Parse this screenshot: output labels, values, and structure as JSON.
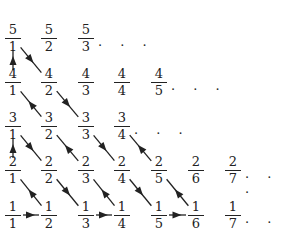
{
  "diagram": {
    "ellipsis": ". . .",
    "fractions": [
      {
        "n": "5",
        "d": "1",
        "col": 0,
        "row": 4
      },
      {
        "n": "5",
        "d": "2",
        "col": 1,
        "row": 4
      },
      {
        "n": "5",
        "d": "3",
        "col": 2,
        "row": 4,
        "dots": true
      },
      {
        "n": "4",
        "d": "1",
        "col": 0,
        "row": 3
      },
      {
        "n": "4",
        "d": "2",
        "col": 1,
        "row": 3
      },
      {
        "n": "4",
        "d": "3",
        "col": 2,
        "row": 3
      },
      {
        "n": "4",
        "d": "4",
        "col": 3,
        "row": 3
      },
      {
        "n": "4",
        "d": "5",
        "col": 4,
        "row": 3,
        "dots": true
      },
      {
        "n": "3",
        "d": "1",
        "col": 0,
        "row": 2
      },
      {
        "n": "3",
        "d": "2",
        "col": 1,
        "row": 2
      },
      {
        "n": "3",
        "d": "3",
        "col": 2,
        "row": 2
      },
      {
        "n": "3",
        "d": "4",
        "col": 3,
        "row": 2,
        "dots": true
      },
      {
        "n": "2",
        "d": "1",
        "col": 0,
        "row": 1
      },
      {
        "n": "2",
        "d": "2",
        "col": 1,
        "row": 1
      },
      {
        "n": "2",
        "d": "3",
        "col": 2,
        "row": 1
      },
      {
        "n": "2",
        "d": "4",
        "col": 3,
        "row": 1
      },
      {
        "n": "2",
        "d": "5",
        "col": 4,
        "row": 1
      },
      {
        "n": "2",
        "d": "6",
        "col": 5,
        "row": 1
      },
      {
        "n": "2",
        "d": "7",
        "col": 6,
        "row": 1,
        "dots": true
      },
      {
        "n": "1",
        "d": "1",
        "col": 0,
        "row": 0
      },
      {
        "n": "1",
        "d": "2",
        "col": 1,
        "row": 0
      },
      {
        "n": "1",
        "d": "3",
        "col": 2,
        "row": 0
      },
      {
        "n": "1",
        "d": "4",
        "col": 3,
        "row": 0
      },
      {
        "n": "1",
        "d": "5",
        "col": 4,
        "row": 0
      },
      {
        "n": "1",
        "d": "6",
        "col": 5,
        "row": 0
      },
      {
        "n": "1",
        "d": "7",
        "col": 6,
        "row": 0,
        "dots": true
      }
    ],
    "path": [
      "1/1",
      "1/2",
      "2/1",
      "3/1",
      "2/2",
      "1/3",
      "1/4",
      "2/3",
      "3/2",
      "4/1",
      "5/1",
      "4/2",
      "3/3",
      "2/4",
      "1/5",
      "1/6",
      "2/5",
      "3/4"
    ],
    "colors": {
      "ink": "#222222",
      "background": "#ffffff"
    }
  }
}
